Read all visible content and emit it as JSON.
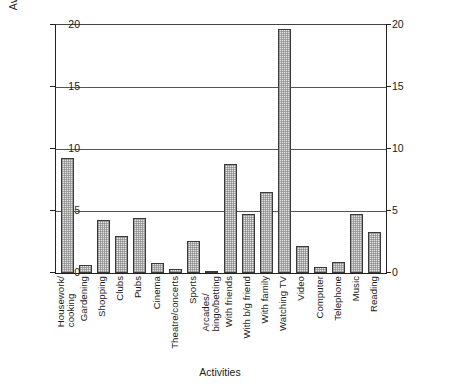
{
  "chart_data": {
    "type": "bar",
    "title": "",
    "xlabel": "Activities",
    "ylabel": "Average time in hours per week",
    "ylim": [
      0,
      20
    ],
    "yticks": [
      0,
      5,
      10,
      15,
      20
    ],
    "y_axis_right": {
      "ticks": [
        0,
        5,
        10,
        15,
        20
      ],
      "label": ""
    },
    "grid": "horizontal",
    "legend": "none",
    "categories": [
      "Housework/cooking",
      "Gardening",
      "Shopping",
      "Clubs",
      "Pubs",
      "Cinema",
      "Theatre/concerts",
      "Sports",
      "Arcades/bingo/betting",
      "With friends",
      "With b/g friend",
      "With family",
      "Watching TV",
      "Video",
      "Computer",
      "Telephone",
      "Music",
      "Reading"
    ],
    "category_lines": [
      [
        "Housework/",
        "cooking"
      ],
      [
        "Gardening"
      ],
      [
        "Shopping"
      ],
      [
        "Clubs"
      ],
      [
        "Pubs"
      ],
      [
        "Cinema"
      ],
      [
        "Theatre/concerts"
      ],
      [
        "Sports"
      ],
      [
        "Arcades/",
        "bingo/betting"
      ],
      [
        "With friends"
      ],
      [
        "With b/g friend"
      ],
      [
        "With family"
      ],
      [
        "Watching TV"
      ],
      [
        "Video"
      ],
      [
        "Computer"
      ],
      [
        "Telephone"
      ],
      [
        "Music"
      ],
      [
        "Reading"
      ]
    ],
    "values": [
      9.3,
      0.65,
      4.3,
      3.0,
      4.4,
      0.8,
      0.35,
      2.6,
      0.15,
      8.8,
      4.75,
      6.5,
      19.7,
      2.2,
      0.5,
      0.85,
      4.75,
      3.3
    ],
    "colors": {
      "bar_fill": "#e3e3e3",
      "bar_edge": "#3a3a3a",
      "gridline": "#555555",
      "axis": "#222222",
      "text": "#1a1a1a",
      "background": "#ffffff"
    }
  }
}
